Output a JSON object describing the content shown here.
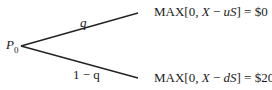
{
  "tree": {
    "root": {
      "label": "P",
      "subscript": "0"
    },
    "branches": [
      {
        "probability": "q",
        "payoff_prefix": "MAX[0, ",
        "payoff_var": "X",
        "payoff_mid": " − ",
        "payoff_factor": "uS",
        "payoff_suffix": "] = $0"
      },
      {
        "probability": "1 − q",
        "payoff_prefix": "MAX[0, ",
        "payoff_var": "X",
        "payoff_mid": " − ",
        "payoff_factor": "dS",
        "payoff_suffix": "] = $20"
      }
    ]
  }
}
